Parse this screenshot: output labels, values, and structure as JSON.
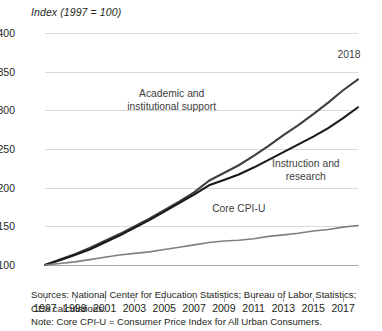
{
  "chart_data": {
    "type": "line",
    "title": "",
    "axis_note": "Index (1997 = 100)",
    "xlabel": "",
    "ylabel": "Index (1997 = 100)",
    "ylim": [
      100,
      400
    ],
    "yticks": [
      100,
      150,
      200,
      250,
      300,
      350,
      400
    ],
    "xlim": [
      1997,
      2018
    ],
    "xticks": [
      1997,
      1999,
      2001,
      2003,
      2005,
      2007,
      2009,
      2011,
      2013,
      2015,
      2017
    ],
    "x": [
      1997,
      1998,
      1999,
      2000,
      2001,
      2002,
      2003,
      2004,
      2005,
      2006,
      2007,
      2008,
      2009,
      2010,
      2011,
      2012,
      2013,
      2014,
      2015,
      2016,
      2017,
      2018
    ],
    "grid": true,
    "legend_position": "inline-annotations",
    "series": [
      {
        "name": "Academic and institutional support",
        "color": "#3f3f3f",
        "values": [
          100,
          107,
          114,
          122,
          131,
          140,
          150,
          160,
          171,
          182,
          194,
          209,
          219,
          229,
          241,
          254,
          268,
          281,
          295,
          310,
          326,
          340
        ]
      },
      {
        "name": "Instruction and research",
        "color": "#1a1a1a",
        "values": [
          100,
          106,
          113,
          120,
          129,
          138,
          148,
          158,
          169,
          180,
          191,
          203,
          210,
          217,
          226,
          236,
          246,
          256,
          266,
          277,
          290,
          304
        ]
      },
      {
        "name": "Core CPI-U",
        "color": "#7f7f7f",
        "values": [
          100,
          102,
          104,
          107,
          110,
          113,
          115,
          117,
          120,
          123,
          126,
          129,
          131,
          132,
          134,
          137,
          139,
          141,
          144,
          146,
          149,
          151
        ]
      }
    ],
    "annotations": [
      {
        "text_line1": "Academic and",
        "text_line2": "institutional support",
        "x": 2005.5,
        "y": 312
      },
      {
        "text_line1": "Instruction and",
        "text_line2": "research",
        "x": 2014.5,
        "y": 222
      },
      {
        "text_line1": "Core CPI-U",
        "text_line2": "",
        "x": 2010,
        "y": 172
      },
      {
        "text_line1": "2018",
        "text_line2": "",
        "x": 2017.4,
        "y": 372
      }
    ]
  },
  "notes": {
    "sources_line1": "Sources: National Center for Education Statistics; Bureau of Labor Statistics;",
    "sources_line2": "CEA calculations.",
    "note_line": "Note: Core CPI-U = Consumer Price Index for All Urban Consumers."
  }
}
